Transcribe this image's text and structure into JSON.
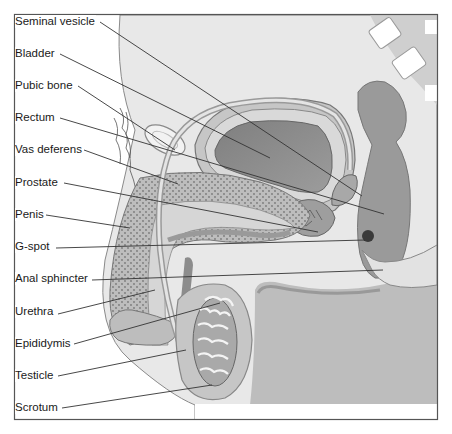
{
  "diagram": {
    "labels": [
      {
        "id": "seminal-vesicle",
        "text": "Seminal vesicle",
        "x": 15,
        "y": 15
      },
      {
        "id": "bladder",
        "text": "Bladder",
        "x": 15,
        "y": 47
      },
      {
        "id": "pubic-bone",
        "text": "Pubic bone",
        "x": 15,
        "y": 79
      },
      {
        "id": "rectum",
        "text": "Rectum",
        "x": 15,
        "y": 111
      },
      {
        "id": "vas-deferens",
        "text": "Vas deferens",
        "x": 15,
        "y": 143
      },
      {
        "id": "prostate",
        "text": "Prostate",
        "x": 15,
        "y": 176
      },
      {
        "id": "penis",
        "text": "Penis",
        "x": 15,
        "y": 208
      },
      {
        "id": "g-spot",
        "text": "G-spot",
        "x": 15,
        "y": 240
      },
      {
        "id": "anal-sphincter",
        "text": "Anal sphincter",
        "x": 15,
        "y": 272
      },
      {
        "id": "urethra",
        "text": "Urethra",
        "x": 15,
        "y": 305
      },
      {
        "id": "epididymis",
        "text": "Epididymis",
        "x": 15,
        "y": 337
      },
      {
        "id": "testicle",
        "text": "Testicle",
        "x": 15,
        "y": 369
      },
      {
        "id": "scrotum",
        "text": "Scrotum",
        "x": 15,
        "y": 401
      }
    ],
    "colors": {
      "frame": "#555555",
      "background_tissue": "#e6e6e6",
      "light_tissue": "#d4d4d4",
      "mid_tissue": "#b8b8b8",
      "dark_organ": "#8c8c8c",
      "darkest": "#555555",
      "leader_line": "#333333"
    }
  }
}
